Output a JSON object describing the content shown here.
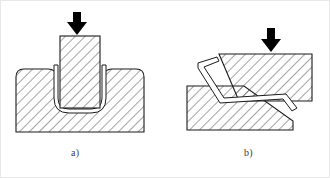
{
  "figure": {
    "background_color": "#ffffff",
    "line_color": "#1a1a1a",
    "hatch_color": "#4a4a4a",
    "arrow_color": "#000000",
    "width": 330,
    "height": 178
  },
  "captions": {
    "a": "a)",
    "b": "b)"
  },
  "panels": [
    {
      "id": "panel-a",
      "label": "a)",
      "name": "u-bending-operation",
      "description": "U-bend / deep draw: punch presses sheet into die cavity",
      "parts": [
        {
          "name": "force-arrow",
          "type": "arrow",
          "direction": "down",
          "color": "#000000"
        },
        {
          "name": "punch",
          "type": "hatched-block",
          "hatched": true
        },
        {
          "name": "sheet-blank",
          "type": "u-shaped-sheet",
          "hatched": false
        },
        {
          "name": "die-block",
          "type": "hatched-block",
          "hatched": true
        }
      ]
    },
    {
      "id": "panel-b",
      "label": "b)",
      "name": "z-bending-operation",
      "description": "Z-bend / offset bend: sheet bent between offset upper and lower tools",
      "parts": [
        {
          "name": "force-arrow",
          "type": "arrow",
          "direction": "down",
          "color": "#000000"
        },
        {
          "name": "upper-tool",
          "type": "hatched-block",
          "hatched": true
        },
        {
          "name": "sheet-blank",
          "type": "z-shaped-sheet",
          "hatched": false
        },
        {
          "name": "lower-tool",
          "type": "hatched-block",
          "hatched": true
        }
      ]
    }
  ]
}
